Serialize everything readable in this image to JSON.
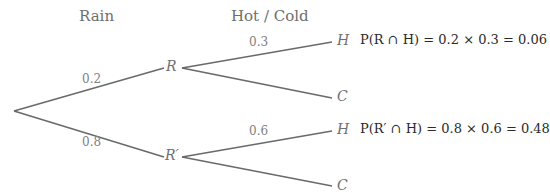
{
  "headers": {
    "stage1": "Rain",
    "stage2": "Hot / Cold"
  },
  "nodes": {
    "r": "R",
    "r_prime": "R′",
    "h1": "H",
    "c1": "C",
    "h2": "H",
    "c2": "C"
  },
  "branch_probs": {
    "root_to_r": "0.2",
    "root_to_r_prime": "0.8",
    "r_to_h": "0.3",
    "r_prime_to_h": "0.6"
  },
  "equations": {
    "r_and_h": "P(R ∩ H) = 0.2 × 0.3 = 0.06",
    "r_prime_and_h": "P(R′ ∩ H) = 0.8 × 0.6 = 0.48"
  },
  "colors": {
    "line": "#6a6a6a",
    "label": "#808080",
    "equation": "#2a2a2a"
  }
}
